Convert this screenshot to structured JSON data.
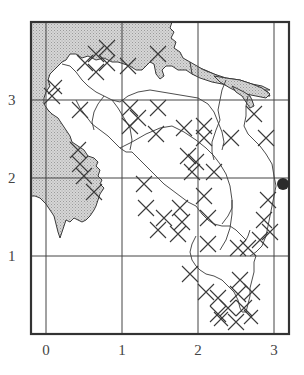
{
  "figure": {
    "type": "grid map",
    "frame": {
      "left": 31,
      "top": 22,
      "right": 289,
      "bottom": 334
    },
    "grid_pixels": {
      "x": {
        "0": 46,
        "1": 122,
        "2": 198,
        "3": 274
      },
      "y": {
        "3": 100,
        "2": 178,
        "1": 256
      }
    },
    "x_ticks": [
      "0",
      "1",
      "2",
      "3"
    ],
    "y_ticks": [
      "3",
      "2",
      "1"
    ],
    "colors": {
      "line": "#3a3a3a",
      "frame": "#333333",
      "land_fill": "#c9c9c9",
      "marker": "#2b2b2b",
      "background": "#ffffff"
    },
    "legend": {
      "shaded": "land / shore area (stippled)",
      "cross": "X marks (sampling sites)",
      "dot": "single filled circle marker"
    },
    "marker": {
      "shape": "filled circle",
      "grid_x": 3.12,
      "grid_y": 1.92,
      "px": 283,
      "py": 184,
      "r": 6
    }
  }
}
